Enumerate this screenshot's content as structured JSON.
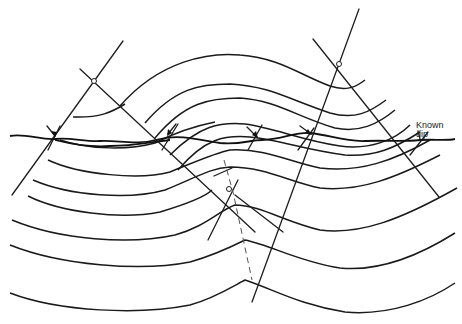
{
  "figure": {
    "annotations": [
      {
        "id": "known-dip",
        "line1": "Known",
        "line2": "dip"
      }
    ],
    "colors": {
      "line": "#1e1e1e",
      "background": "#ffffff"
    }
  }
}
